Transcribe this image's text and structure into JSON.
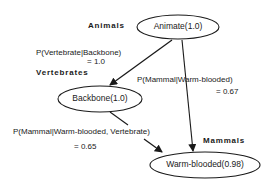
{
  "nodes": {
    "animate": {
      "label": "Animate(1.0)",
      "group": "Animals"
    },
    "backbone": {
      "label": "Backbone(1.0)",
      "group": "Vertebrates"
    },
    "warm": {
      "label": "Warm-blooded(0.98)",
      "group": "Mammals"
    }
  },
  "edges": {
    "animate_backbone": {
      "line1": "P(Vertebrate|Backbone)",
      "line2": "= 1.0"
    },
    "animate_warm": {
      "line1": "P(Mammal|Warm-blooded)",
      "line2": "= 0.67"
    },
    "backbone_warm": {
      "line1": "P(Mammal|Warm-blooded, Vertebrate)",
      "line2": "= 0.65"
    }
  }
}
